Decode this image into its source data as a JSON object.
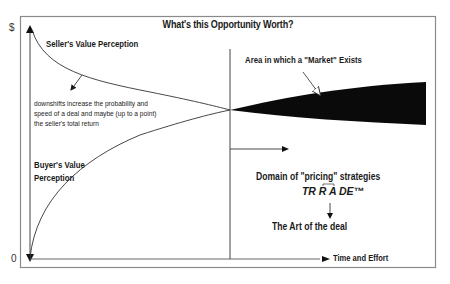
{
  "title": "What's this Opportunity Worth?",
  "axes": {
    "y_top_label": "$",
    "y_origin_label": "0",
    "x_label": "Time and Effort"
  },
  "curves": {
    "seller_label": "Seller's Value Perception",
    "buyer_label_line1": "Buyer's Value",
    "buyer_label_line2": "Perception"
  },
  "annotations": {
    "downshift_line1": "downshifts increase the probability and",
    "downshift_line2": "speed of a deal and maybe (up to a point)",
    "downshift_line3": "the seller's total return",
    "market_area": "Area in which a \"Market\" Exists",
    "pricing_domain": "Domain of \"pricing\" strategies",
    "trade_mark": "TR R A DE™",
    "art_of_deal": "The Art of the deal"
  },
  "colors": {
    "frame": "#808080",
    "ink": "#1a1a1a",
    "market_fill": "#0a0a0a"
  }
}
